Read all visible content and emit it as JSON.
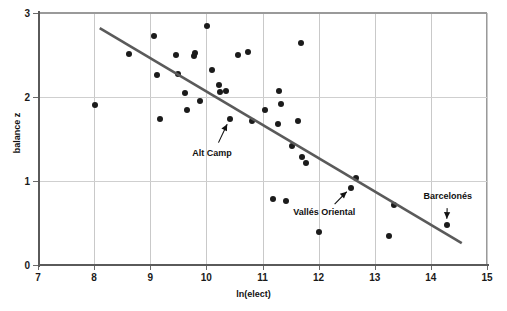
{
  "chart_data": {
    "type": "scatter",
    "title": "",
    "xlabel": "ln(elect)",
    "ylabel": "balance z",
    "xlim": [
      7,
      15
    ],
    "ylim": [
      0,
      3
    ],
    "xticks": [
      7,
      8,
      9,
      10,
      11,
      12,
      13,
      14,
      15
    ],
    "yticks": [
      0,
      1,
      2,
      3
    ],
    "grid": true,
    "legend": "none",
    "point_color": "#1b1b1b",
    "trendline_color": "#5a5a5a",
    "points": [
      {
        "x": 8.02,
        "y": 1.91
      },
      {
        "x": 8.62,
        "y": 2.51
      },
      {
        "x": 9.07,
        "y": 2.73
      },
      {
        "x": 9.12,
        "y": 2.26
      },
      {
        "x": 9.18,
        "y": 1.74
      },
      {
        "x": 9.45,
        "y": 2.5
      },
      {
        "x": 9.5,
        "y": 2.27
      },
      {
        "x": 9.62,
        "y": 2.05
      },
      {
        "x": 9.66,
        "y": 1.84
      },
      {
        "x": 9.78,
        "y": 2.49
      },
      {
        "x": 9.8,
        "y": 2.52
      },
      {
        "x": 9.88,
        "y": 1.95
      },
      {
        "x": 10.02,
        "y": 2.85
      },
      {
        "x": 10.1,
        "y": 2.32
      },
      {
        "x": 10.23,
        "y": 2.14
      },
      {
        "x": 10.25,
        "y": 2.06
      },
      {
        "x": 10.35,
        "y": 2.07
      },
      {
        "x": 10.42,
        "y": 1.74
      },
      {
        "x": 10.56,
        "y": 2.5
      },
      {
        "x": 10.74,
        "y": 2.54
      },
      {
        "x": 10.82,
        "y": 1.71
      },
      {
        "x": 11.05,
        "y": 1.85
      },
      {
        "x": 11.18,
        "y": 0.78
      },
      {
        "x": 11.27,
        "y": 1.68
      },
      {
        "x": 11.3,
        "y": 2.07
      },
      {
        "x": 11.33,
        "y": 1.92
      },
      {
        "x": 11.42,
        "y": 0.76
      },
      {
        "x": 11.52,
        "y": 1.42
      },
      {
        "x": 11.63,
        "y": 1.72
      },
      {
        "x": 11.68,
        "y": 2.64
      },
      {
        "x": 11.7,
        "y": 1.29
      },
      {
        "x": 11.78,
        "y": 1.22
      },
      {
        "x": 12.0,
        "y": 0.39
      },
      {
        "x": 12.58,
        "y": 0.92
      },
      {
        "x": 12.66,
        "y": 1.03
      },
      {
        "x": 13.25,
        "y": 0.35
      },
      {
        "x": 13.34,
        "y": 0.71
      },
      {
        "x": 14.28,
        "y": 0.48
      }
    ],
    "trendline": {
      "x_start": 8.1,
      "y_start": 2.82,
      "x_end": 14.55,
      "y_end": 0.26
    },
    "annotations": [
      {
        "label": "Alt Camp",
        "label_x": 10.1,
        "label_y": 1.33,
        "target_x": 10.42,
        "target_y": 1.74
      },
      {
        "label": "Vallés Oriental",
        "label_x": 12.1,
        "label_y": 0.63,
        "target_x": 12.58,
        "target_y": 0.92
      },
      {
        "label": "Barcelonés",
        "label_x": 14.3,
        "label_y": 0.82,
        "target_x": 14.28,
        "target_y": 0.48
      }
    ]
  }
}
